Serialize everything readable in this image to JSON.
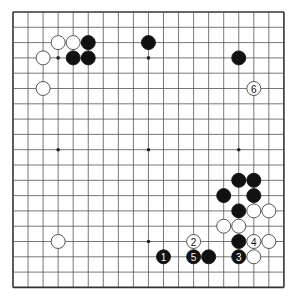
{
  "board": {
    "size": 19,
    "origin": {
      "x": 13,
      "y": 12
    },
    "spacing": {
      "x": 15.05,
      "y": 15.3
    },
    "stone_radius": 7,
    "colors": {
      "background": "#ffffff",
      "line": "#555555",
      "border": "#333333",
      "black_stone": "#111111",
      "white_stone": "#ffffff",
      "white_stroke": "#444444",
      "star": "#222222"
    },
    "star_points": [
      [
        3,
        3
      ],
      [
        9,
        3
      ],
      [
        15,
        3
      ],
      [
        3,
        9
      ],
      [
        9,
        9
      ],
      [
        15,
        9
      ],
      [
        3,
        15
      ],
      [
        9,
        15
      ],
      [
        15,
        15
      ]
    ]
  },
  "stones": [
    {
      "color": "white",
      "col": 3,
      "row": 2,
      "label": ""
    },
    {
      "color": "white",
      "col": 4,
      "row": 2,
      "label": ""
    },
    {
      "color": "black",
      "col": 5,
      "row": 2,
      "label": ""
    },
    {
      "color": "white",
      "col": 2,
      "row": 3,
      "label": ""
    },
    {
      "color": "black",
      "col": 4,
      "row": 3,
      "label": ""
    },
    {
      "color": "black",
      "col": 5,
      "row": 3,
      "label": ""
    },
    {
      "color": "white",
      "col": 2,
      "row": 5,
      "label": ""
    },
    {
      "color": "black",
      "col": 9,
      "row": 2,
      "label": ""
    },
    {
      "color": "black",
      "col": 15,
      "row": 3,
      "label": ""
    },
    {
      "color": "white",
      "col": 16,
      "row": 5,
      "label": "6"
    },
    {
      "color": "black",
      "col": 15,
      "row": 11,
      "label": ""
    },
    {
      "color": "black",
      "col": 16,
      "row": 11,
      "label": ""
    },
    {
      "color": "black",
      "col": 14,
      "row": 12,
      "label": ""
    },
    {
      "color": "black",
      "col": 16,
      "row": 12,
      "label": ""
    },
    {
      "color": "black",
      "col": 15,
      "row": 13,
      "label": ""
    },
    {
      "color": "white",
      "col": 16,
      "row": 13,
      "label": ""
    },
    {
      "color": "white",
      "col": 17,
      "row": 13,
      "label": ""
    },
    {
      "color": "white",
      "col": 14,
      "row": 14,
      "label": ""
    },
    {
      "color": "white",
      "col": 15,
      "row": 14,
      "label": ""
    },
    {
      "color": "black",
      "col": 15,
      "row": 15,
      "label": ""
    },
    {
      "color": "white",
      "col": 16,
      "row": 15,
      "label": "4"
    },
    {
      "color": "white",
      "col": 17,
      "row": 15,
      "label": ""
    },
    {
      "color": "black",
      "col": 15,
      "row": 16,
      "label": "3"
    },
    {
      "color": "white",
      "col": 16,
      "row": 16,
      "label": ""
    },
    {
      "color": "black",
      "col": 10,
      "row": 16,
      "label": "1"
    },
    {
      "color": "white",
      "col": 12,
      "row": 15,
      "label": "2"
    },
    {
      "color": "black",
      "col": 12,
      "row": 16,
      "label": "5"
    },
    {
      "color": "black",
      "col": 13,
      "row": 16,
      "label": ""
    },
    {
      "color": "white",
      "col": 3,
      "row": 15,
      "label": ""
    }
  ]
}
